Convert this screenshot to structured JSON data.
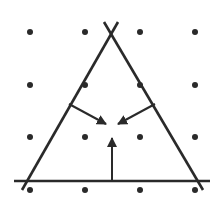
{
  "diagram": {
    "colors": {
      "ink": "#2a2a2a",
      "dot": "#2a2a2a",
      "background": "#ffffff"
    },
    "dot_grid": {
      "columns_x": [
        30,
        85,
        140,
        195
      ],
      "rows_y": [
        32,
        85,
        137,
        190
      ],
      "radius": 3
    },
    "lines": [
      {
        "name": "left-side",
        "x1": 118,
        "y1": 22,
        "x2": 22,
        "y2": 190
      },
      {
        "name": "right-side",
        "x1": 104,
        "y1": 22,
        "x2": 203,
        "y2": 190
      },
      {
        "name": "base",
        "x1": 14,
        "y1": 181,
        "x2": 210,
        "y2": 181
      }
    ],
    "arrows": [
      {
        "name": "arrow-from-left-side",
        "x1": 69,
        "y1": 104,
        "x2": 106,
        "y2": 124
      },
      {
        "name": "arrow-from-right-side",
        "x1": 155,
        "y1": 104,
        "x2": 118,
        "y2": 124
      },
      {
        "name": "arrow-from-base",
        "x1": 112,
        "y1": 181,
        "x2": 112,
        "y2": 138
      }
    ]
  }
}
